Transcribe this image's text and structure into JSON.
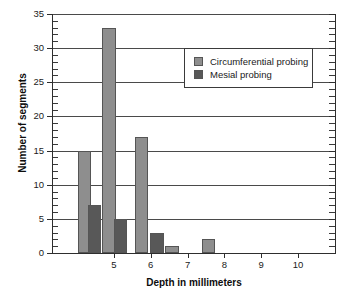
{
  "chart_data": {
    "type": "bar",
    "title": "",
    "xlabel": "Depth in millimeters",
    "ylabel": "Number of segments",
    "xlim": [
      3.35,
      11.0
    ],
    "ylim": [
      0,
      35
    ],
    "xticks": [
      5,
      6,
      7,
      8,
      9,
      10
    ],
    "xtick_labels": [
      "5",
      "6",
      "7",
      "8",
      "9",
      "10"
    ],
    "yticks": [
      0,
      5,
      10,
      15,
      20,
      25,
      30,
      35
    ],
    "ytick_labels": [
      "0",
      "5",
      "10",
      "15",
      "20",
      "25",
      "30",
      "35"
    ],
    "y_minor_tick_step": 1,
    "grid": "horizontal-major",
    "legend_position": "upper-right-inside",
    "series": [
      {
        "name": "Circumferential probing",
        "color": "#8e8e8e",
        "x": [
          4.2,
          4.87,
          5.75,
          6.58,
          7.57
        ],
        "values": [
          15,
          33,
          17,
          1,
          2
        ]
      },
      {
        "name": "Mesial probing",
        "color": "#585858",
        "x": [
          4.47,
          5.18,
          6.17
        ],
        "values": [
          7,
          5,
          3
        ]
      }
    ]
  },
  "legend": {
    "items": [
      {
        "label": "Circumferential probing",
        "color": "#8e8e8e"
      },
      {
        "label": "Mesial probing",
        "color": "#585858"
      }
    ]
  },
  "colors": {
    "background": "#ffffff",
    "axis": "#2e2e2e",
    "gridline": "#4a4a4a",
    "bar_light": "#8e8e8e",
    "bar_dark": "#585858",
    "bar_edge": "#555555",
    "text": "#1a1a1a"
  }
}
